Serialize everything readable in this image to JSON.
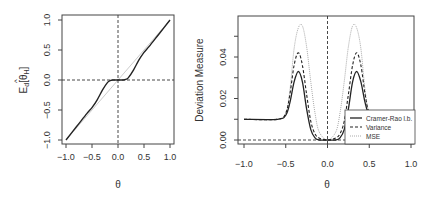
{
  "chart_data": [
    {
      "type": "line",
      "title": "",
      "xlabel": "θ",
      "ylabel": "E_d[θ̂_H]",
      "xlim": [
        -1.0,
        1.0
      ],
      "ylim": [
        -1.0,
        1.0
      ],
      "xticks": [
        "-1.0",
        "-0.5",
        "0.0",
        "0.5",
        "1.0"
      ],
      "yticks": [
        "-1.0",
        "-0.5",
        "0.0",
        "0.5",
        "1.0"
      ],
      "reference_lines": [
        {
          "type": "hline",
          "y": 0.0,
          "style": "dashed"
        },
        {
          "type": "vline",
          "x": 0.0,
          "style": "dashed"
        },
        {
          "type": "diagonal",
          "from": [
            -1,
            -1
          ],
          "to": [
            1,
            1
          ],
          "style": "solid-light"
        }
      ],
      "series": [
        {
          "name": "E_d[θ̂_H]",
          "x": [
            -1.0,
            -0.8,
            -0.6,
            -0.5,
            -0.4,
            -0.3,
            -0.2,
            -0.15,
            -0.1,
            0.0,
            0.1,
            0.15,
            0.2,
            0.3,
            0.4,
            0.5,
            0.6,
            0.8,
            1.0
          ],
          "y": [
            -1.0,
            -0.78,
            -0.56,
            -0.46,
            -0.33,
            -0.17,
            -0.04,
            -0.01,
            0.0,
            0.0,
            0.0,
            0.01,
            0.04,
            0.17,
            0.33,
            0.46,
            0.56,
            0.78,
            1.0
          ]
        }
      ]
    },
    {
      "type": "line",
      "title": "",
      "xlabel": "θ",
      "ylabel": "Deviation Measure",
      "xlim": [
        -1.0,
        1.0
      ],
      "ylim": [
        0.0,
        0.055
      ],
      "xticks": [
        "-1.0",
        "-0.5",
        "0.0",
        "0.5",
        "1.0"
      ],
      "yticks": [
        "0.00",
        "0.02",
        "0.04"
      ],
      "reference_lines": [
        {
          "type": "hline",
          "y": 0.0,
          "style": "dashed"
        },
        {
          "type": "vline",
          "x": 0.0,
          "style": "dashed"
        }
      ],
      "legend": {
        "position": "bottom-right",
        "entries": [
          "Cramer-Rao l.b.",
          "Variance",
          "MSE"
        ]
      },
      "series": [
        {
          "name": "Cramer-Rao l.b.",
          "style": "solid",
          "x": [
            -1.0,
            -0.6,
            -0.5,
            -0.45,
            -0.4,
            -0.35,
            -0.3,
            -0.25,
            -0.2,
            -0.15,
            -0.1,
            0.0,
            0.1,
            0.15,
            0.2,
            0.25,
            0.3,
            0.35,
            0.4,
            0.45,
            0.5,
            0.6,
            1.0
          ],
          "y": [
            0.01,
            0.01,
            0.012,
            0.018,
            0.028,
            0.033,
            0.028,
            0.015,
            0.005,
            0.001,
            0.0,
            0.0,
            0.0,
            0.001,
            0.005,
            0.015,
            0.028,
            0.033,
            0.028,
            0.018,
            0.012,
            0.01,
            0.01
          ]
        },
        {
          "name": "Variance",
          "style": "dashed",
          "x": [
            -1.0,
            -0.6,
            -0.5,
            -0.45,
            -0.4,
            -0.35,
            -0.3,
            -0.25,
            -0.2,
            -0.15,
            -0.1,
            0.0,
            0.1,
            0.15,
            0.2,
            0.25,
            0.3,
            0.35,
            0.4,
            0.45,
            0.5,
            0.6,
            1.0
          ],
          "y": [
            0.01,
            0.01,
            0.013,
            0.022,
            0.036,
            0.042,
            0.036,
            0.022,
            0.009,
            0.003,
            0.001,
            0.0,
            0.001,
            0.003,
            0.009,
            0.022,
            0.036,
            0.042,
            0.036,
            0.022,
            0.013,
            0.01,
            0.01
          ]
        },
        {
          "name": "MSE",
          "style": "dotted",
          "x": [
            -1.0,
            -0.6,
            -0.5,
            -0.45,
            -0.4,
            -0.35,
            -0.3,
            -0.25,
            -0.2,
            -0.15,
            -0.1,
            0.0,
            0.1,
            0.15,
            0.2,
            0.25,
            0.3,
            0.35,
            0.4,
            0.45,
            0.5,
            0.6,
            1.0
          ],
          "y": [
            0.01,
            0.01,
            0.013,
            0.024,
            0.044,
            0.054,
            0.055,
            0.045,
            0.028,
            0.013,
            0.004,
            0.0,
            0.004,
            0.013,
            0.028,
            0.045,
            0.055,
            0.054,
            0.044,
            0.024,
            0.013,
            0.01,
            0.01
          ]
        }
      ]
    }
  ],
  "left_plot": {
    "ylabel_main": "E",
    "ylabel_sub": "d",
    "ylabel_inner": "θ",
    "ylabel_inner_sub": "H",
    "xlabel": "θ",
    "xticks": [
      "-1.0",
      "-0.5",
      "0.0",
      "0.5",
      "1.0"
    ],
    "yticks": [
      "-1.0",
      "-0.5",
      "0.0",
      "0.5",
      "1.0"
    ]
  },
  "right_plot": {
    "ylabel": "Deviation Measure",
    "xlabel": "θ",
    "xticks": [
      "-1.0",
      "-0.5",
      "0.0",
      "0.5",
      "1.0"
    ],
    "yticks": [
      "0.00",
      "0.02",
      "0.04"
    ],
    "legend": [
      "Cramer-Rao l.b.",
      "Variance",
      "MSE"
    ]
  }
}
